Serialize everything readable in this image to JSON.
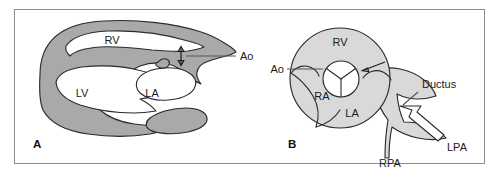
{
  "figure": {
    "caption_present": false,
    "background_color": "#ffffff",
    "frame_border_color": "#8d8d8d",
    "wall_fill_color": "#a9a9a9",
    "chamber_fill_color": "#ffffff",
    "cross_section_fill_color": "#d9d9d9",
    "outline_color": "#2b2b2b",
    "text_color": "#1b1b1b"
  },
  "panels": [
    {
      "id": "panel-a",
      "letter": "A",
      "view": "long-axis",
      "labels": [
        {
          "key": "rv",
          "text": "RV",
          "x": 112,
          "y": 44
        },
        {
          "key": "lv",
          "text": "LV",
          "x": 82,
          "y": 97
        },
        {
          "key": "la",
          "text": "LA",
          "x": 152,
          "y": 97
        },
        {
          "key": "ao",
          "text": "Ao",
          "x": 240,
          "y": 57
        }
      ],
      "annotations": [
        {
          "key": "ao-leader",
          "type": "leader-line"
        },
        {
          "key": "aorta-caliber-arrow",
          "type": "double-headed-arrow"
        }
      ]
    },
    {
      "id": "panel-b",
      "letter": "B",
      "view": "short-axis",
      "labels": [
        {
          "key": "rv",
          "text": "RV",
          "x": 340,
          "y": 43
        },
        {
          "key": "ao",
          "text": "Ao",
          "x": 273,
          "y": 72
        },
        {
          "key": "ra",
          "text": "RA",
          "x": 322,
          "y": 97
        },
        {
          "key": "la",
          "text": "LA",
          "x": 352,
          "y": 114
        },
        {
          "key": "ductus",
          "text": "Ductus",
          "x": 430,
          "y": 84
        },
        {
          "key": "rpa",
          "text": "RPA",
          "x": 390,
          "y": 164
        },
        {
          "key": "lpa",
          "text": "LPA",
          "x": 443,
          "y": 148
        }
      ],
      "annotations": [
        {
          "key": "ao-leader",
          "type": "leader-line"
        },
        {
          "key": "valve-pointer-arrow",
          "type": "single-headed-arrow"
        },
        {
          "key": "ductus-leader",
          "type": "leader-line"
        },
        {
          "key": "ductus-block-arrow",
          "type": "block-arrow"
        },
        {
          "key": "semilunar-valve",
          "type": "tri-leaflet-valve"
        }
      ]
    }
  ]
}
